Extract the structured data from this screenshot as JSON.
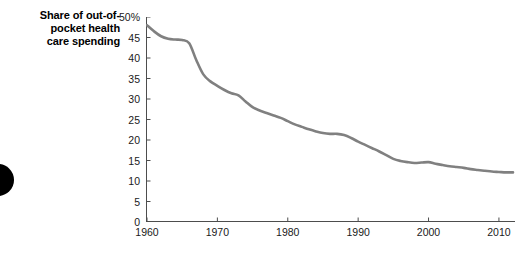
{
  "chart_title": "Share of out-of-\npocket health\ncare spending",
  "decoration": {
    "edge_dot_name": "black-circle-mark"
  },
  "style": {
    "line_color": "#808080",
    "axis_color": "#4d4d4d",
    "text_color": "#1a1a1a",
    "background": "#ffffff",
    "dot_color": "#000000"
  },
  "chart_data": {
    "type": "line",
    "xlabel": "",
    "ylabel": "",
    "xlim": [
      1960,
      2012
    ],
    "ylim": [
      0,
      50
    ],
    "grid": false,
    "legend": "none",
    "y_tick_labels": [
      "50%",
      "45",
      "40",
      "35",
      "30",
      "25",
      "20",
      "15",
      "10",
      "5",
      "0"
    ],
    "y_ticks": [
      50,
      45,
      40,
      35,
      30,
      25,
      20,
      15,
      10,
      5,
      0
    ],
    "x_tick_labels": [
      "1960",
      "1970",
      "1980",
      "1990",
      "2000",
      "2010"
    ],
    "x_ticks": [
      1960,
      1970,
      1980,
      1990,
      2000,
      2010
    ],
    "series": [
      {
        "name": "Share of out-of-pocket health care spending",
        "color": "#808080",
        "x": [
          1960,
          1961,
          1962,
          1963,
          1964,
          1965,
          1966,
          1967,
          1968,
          1969,
          1970,
          1971,
          1972,
          1973,
          1974,
          1975,
          1976,
          1977,
          1978,
          1979,
          1980,
          1981,
          1982,
          1983,
          1984,
          1985,
          1986,
          1987,
          1988,
          1989,
          1990,
          1991,
          1992,
          1993,
          1994,
          1995,
          1996,
          1997,
          1998,
          1999,
          2000,
          2001,
          2002,
          2003,
          2004,
          2005,
          2006,
          2007,
          2008,
          2009,
          2010,
          2011,
          2012
        ],
        "values": [
          48.0,
          46.5,
          45.3,
          44.7,
          44.5,
          44.4,
          43.6,
          39.5,
          36.0,
          34.3,
          33.2,
          32.2,
          31.4,
          30.9,
          29.4,
          28.0,
          27.2,
          26.6,
          26.0,
          25.4,
          24.6,
          23.8,
          23.2,
          22.6,
          22.1,
          21.7,
          21.5,
          21.5,
          21.2,
          20.5,
          19.6,
          18.8,
          18.0,
          17.2,
          16.3,
          15.4,
          14.9,
          14.6,
          14.4,
          14.5,
          14.6,
          14.2,
          13.9,
          13.6,
          13.4,
          13.2,
          12.9,
          12.7,
          12.5,
          12.3,
          12.2,
          12.1,
          12.1
        ]
      }
    ]
  }
}
